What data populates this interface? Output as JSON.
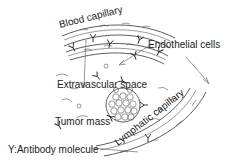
{
  "diagram": {
    "labels": {
      "blood_capillary": "Blood capillary",
      "endothelial_cells": "Endothelial cells",
      "extravascular_space": "Extravascular space",
      "tumor_mass": "Tumor mass",
      "lymphatic_capillary": "Lymphatic capillary",
      "legend": "Y:Antibody molecule"
    },
    "colors": {
      "line": "#333333",
      "text": "#222222",
      "background": "#ffffff"
    }
  }
}
